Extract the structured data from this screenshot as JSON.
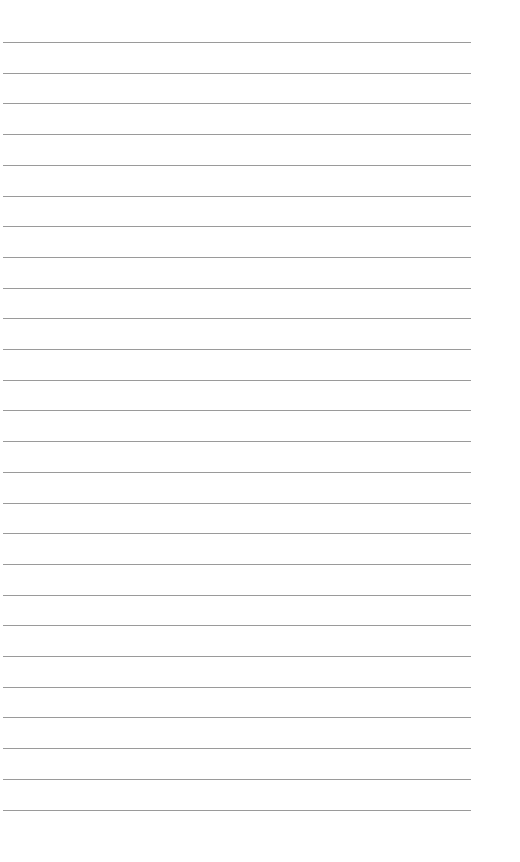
{
  "document": {
    "type": "lined-paper",
    "background_color": "#ffffff",
    "line_color": "#9a9a9a",
    "line_count": 26,
    "first_line_y": 42,
    "line_spacing": 30.7,
    "line_left": 3,
    "line_right": 471
  }
}
